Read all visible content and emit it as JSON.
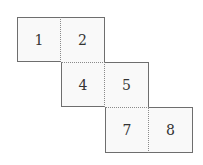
{
  "diagram": {
    "type": "cube-net",
    "cells": [
      {
        "label": "1",
        "row": 0,
        "col": 0
      },
      {
        "label": "2",
        "row": 0,
        "col": 1
      },
      {
        "label": "4",
        "row": 1,
        "col": 1
      },
      {
        "label": "5",
        "row": 1,
        "col": 2
      },
      {
        "label": "7",
        "row": 2,
        "col": 2
      },
      {
        "label": "8",
        "row": 2,
        "col": 3
      }
    ],
    "colors": {
      "solid_edge": "#6e6e6e",
      "fold_edge": "#8a8a8a",
      "cell_fill": "#f9f9f9",
      "text": "#333333"
    }
  }
}
